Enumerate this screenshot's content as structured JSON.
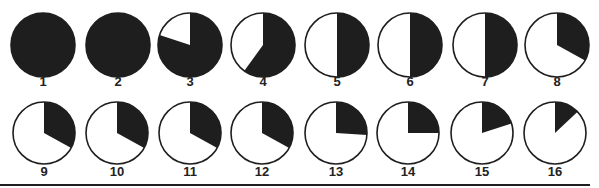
{
  "diagram": {
    "title": "",
    "ink_color": "#1e1e1e",
    "fill_color": "#ffffff",
    "rows": [
      {
        "cy": 45,
        "r": 32,
        "label_y": 86,
        "items": [
          {
            "label": "1",
            "cx": 43,
            "dark_fraction": 1.0
          },
          {
            "label": "2",
            "cx": 118,
            "dark_fraction": 1.0
          },
          {
            "label": "3",
            "cx": 190,
            "dark_fraction": 0.8
          },
          {
            "label": "4",
            "cx": 263,
            "dark_fraction": 0.6
          },
          {
            "label": "5",
            "cx": 337,
            "dark_fraction": 0.5
          },
          {
            "label": "6",
            "cx": 410,
            "dark_fraction": 0.5
          },
          {
            "label": "7",
            "cx": 485,
            "dark_fraction": 0.5
          },
          {
            "label": "8",
            "cx": 557,
            "dark_fraction": 0.33
          }
        ]
      },
      {
        "cy": 133,
        "r": 31,
        "label_y": 176,
        "items": [
          {
            "label": "9",
            "cx": 44,
            "dark_fraction": 0.33
          },
          {
            "label": "10",
            "cx": 117,
            "dark_fraction": 0.33
          },
          {
            "label": "11",
            "cx": 190,
            "dark_fraction": 0.33
          },
          {
            "label": "12",
            "cx": 262,
            "dark_fraction": 0.33
          },
          {
            "label": "13",
            "cx": 336,
            "dark_fraction": 0.26
          },
          {
            "label": "14",
            "cx": 408,
            "dark_fraction": 0.25
          },
          {
            "label": "15",
            "cx": 482,
            "dark_fraction": 0.2
          },
          {
            "label": "16",
            "cx": 555,
            "dark_fraction": 0.13
          }
        ]
      }
    ],
    "divider": {
      "y": 185,
      "x1": 0,
      "x2": 590,
      "thickness": 2
    }
  }
}
